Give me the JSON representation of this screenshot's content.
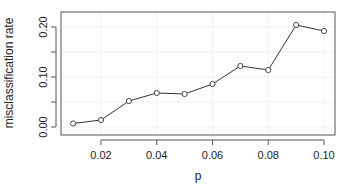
{
  "chart_data": {
    "type": "line",
    "title": "",
    "xlabel": "p",
    "ylabel": "misclassification rate",
    "x": [
      0.01,
      0.02,
      0.03,
      0.04,
      0.05,
      0.06,
      0.07,
      0.08,
      0.09,
      0.1
    ],
    "series": [
      {
        "name": "misclassification rate",
        "values": [
          0.007,
          0.014,
          0.052,
          0.068,
          0.066,
          0.086,
          0.122,
          0.114,
          0.204,
          0.192
        ],
        "marker": "open-circle",
        "color": "#333333"
      }
    ],
    "xticks": [
      0.02,
      0.04,
      0.06,
      0.08,
      0.1
    ],
    "xtick_labels": [
      "0.02",
      "0.04",
      "0.06",
      "0.08",
      "0.10"
    ],
    "yticks": [
      0.0,
      0.05,
      0.1,
      0.15,
      0.2
    ],
    "ytick_labels": [
      "0.00",
      "",
      "0.10",
      "",
      "0.20"
    ],
    "xlim": [
      0.0062,
      0.1045
    ],
    "ylim": [
      -0.016,
      0.23
    ],
    "grid": true,
    "legend": null
  }
}
